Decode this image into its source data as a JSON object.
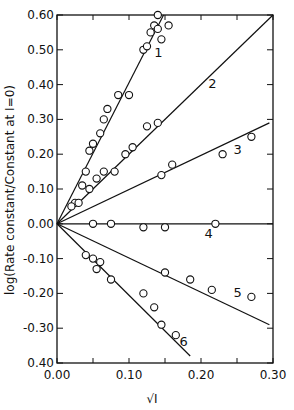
{
  "chart_data": {
    "type": "scatter",
    "title": "",
    "xlabel": "√I",
    "ylabel": "log(Rate constant/Constant at I=0)",
    "xlim": [
      0.0,
      0.3
    ],
    "ylim": [
      -0.4,
      0.6
    ],
    "x_ticks": [
      "0.00",
      "0.10",
      "0.20",
      "0.30"
    ],
    "y_ticks": [
      "0.60",
      "0.50",
      "0.40",
      "0.30",
      "0.20",
      "0.10",
      "0.00",
      "-0.10",
      "-0.20",
      "-0.30",
      "0.40"
    ],
    "grid": false,
    "series": [
      {
        "name": "1",
        "fit_slope": 4.05,
        "points": [
          [
            0.025,
            0.06
          ],
          [
            0.035,
            0.11
          ],
          [
            0.04,
            0.15
          ],
          [
            0.045,
            0.21
          ],
          [
            0.05,
            0.23
          ],
          [
            0.06,
            0.26
          ],
          [
            0.065,
            0.3
          ],
          [
            0.07,
            0.33
          ],
          [
            0.085,
            0.37
          ],
          [
            0.1,
            0.37
          ],
          [
            0.12,
            0.5
          ],
          [
            0.125,
            0.51
          ],
          [
            0.13,
            0.55
          ],
          [
            0.135,
            0.57
          ],
          [
            0.14,
            0.6
          ],
          [
            0.14,
            0.56
          ],
          [
            0.145,
            0.53
          ],
          [
            0.155,
            0.57
          ]
        ]
      },
      {
        "name": "2",
        "fit_slope": 2.0,
        "points": [
          [
            0.02,
            0.05
          ],
          [
            0.03,
            0.06
          ],
          [
            0.045,
            0.1
          ],
          [
            0.055,
            0.13
          ],
          [
            0.065,
            0.15
          ],
          [
            0.08,
            0.15
          ],
          [
            0.095,
            0.2
          ],
          [
            0.105,
            0.22
          ],
          [
            0.125,
            0.28
          ],
          [
            0.14,
            0.29
          ]
        ]
      },
      {
        "name": "3",
        "fit_slope": 0.98,
        "points": [
          [
            0.145,
            0.14
          ],
          [
            0.16,
            0.17
          ],
          [
            0.23,
            0.2
          ],
          [
            0.27,
            0.25
          ]
        ]
      },
      {
        "name": "4",
        "fit_slope": 0.0,
        "points": [
          [
            0.05,
            0.0
          ],
          [
            0.075,
            0.0
          ],
          [
            0.12,
            -0.01
          ],
          [
            0.15,
            -0.01
          ],
          [
            0.22,
            0.0
          ]
        ]
      },
      {
        "name": "5",
        "fit_slope": -0.99,
        "points": [
          [
            0.15,
            -0.14
          ],
          [
            0.185,
            -0.16
          ],
          [
            0.215,
            -0.19
          ],
          [
            0.27,
            -0.21
          ]
        ]
      },
      {
        "name": "6",
        "fit_slope": -2.05,
        "points": [
          [
            0.04,
            -0.09
          ],
          [
            0.05,
            -0.1
          ],
          [
            0.055,
            -0.13
          ],
          [
            0.06,
            -0.11
          ],
          [
            0.075,
            -0.16
          ],
          [
            0.12,
            -0.2
          ],
          [
            0.135,
            -0.24
          ],
          [
            0.145,
            -0.29
          ],
          [
            0.165,
            -0.32
          ]
        ]
      }
    ],
    "fit_lines": [
      {
        "name": "1",
        "x_end": 0.148,
        "y_end": 0.6,
        "label_at": [
          0.135,
          0.48
        ]
      },
      {
        "name": "2",
        "x_end": 0.3,
        "y_end": 0.6,
        "label_at": [
          0.21,
          0.39
        ]
      },
      {
        "name": "3",
        "x_end": 0.295,
        "y_end": 0.29,
        "label_at": [
          0.245,
          0.2
        ]
      },
      {
        "name": "4",
        "x_end": 0.3,
        "y_end": 0.0,
        "label_at": [
          0.205,
          -0.04
        ]
      },
      {
        "name": "5",
        "x_end": 0.295,
        "y_end": -0.29,
        "label_at": [
          0.245,
          -0.21
        ]
      },
      {
        "name": "6",
        "x_end": 0.185,
        "y_end": -0.38,
        "label_at": [
          0.17,
          -0.35
        ]
      }
    ]
  }
}
